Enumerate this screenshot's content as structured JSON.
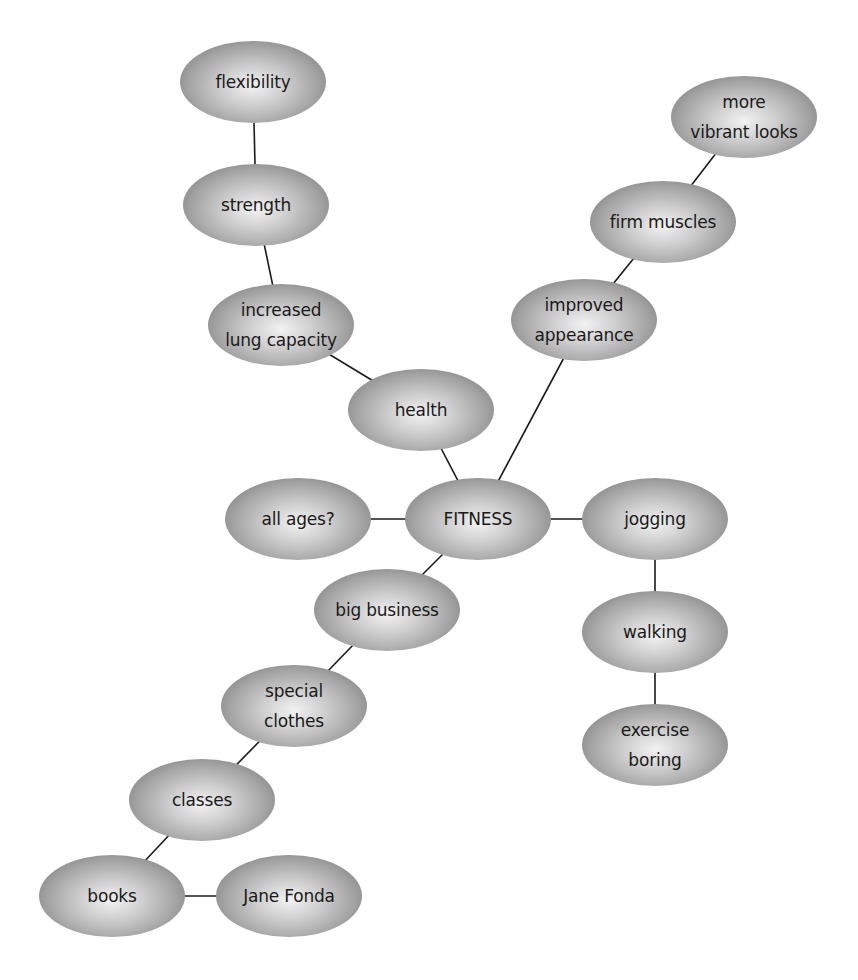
{
  "diagram": {
    "type": "mind-map",
    "central_topic": "FITNESS",
    "nodes": [
      {
        "id": "flexibility",
        "label": "flexibility",
        "x": 253,
        "y": 82
      },
      {
        "id": "strength",
        "label": "strength",
        "x": 256,
        "y": 205
      },
      {
        "id": "lung",
        "label": "increased\nlung capacity",
        "x": 281,
        "y": 325
      },
      {
        "id": "health",
        "label": "health",
        "x": 421,
        "y": 410
      },
      {
        "id": "appearance",
        "label": "improved\nappearance",
        "x": 584,
        "y": 320
      },
      {
        "id": "muscles",
        "label": "firm muscles",
        "x": 663,
        "y": 222
      },
      {
        "id": "vibrant",
        "label": "more\nvibrant looks",
        "x": 744,
        "y": 117
      },
      {
        "id": "ages",
        "label": "all ages?",
        "x": 298,
        "y": 519
      },
      {
        "id": "fitness",
        "label": "FITNESS",
        "x": 478,
        "y": 519
      },
      {
        "id": "jogging",
        "label": "jogging",
        "x": 655,
        "y": 519
      },
      {
        "id": "business",
        "label": "big business",
        "x": 387,
        "y": 610
      },
      {
        "id": "walking",
        "label": "walking",
        "x": 655,
        "y": 632
      },
      {
        "id": "clothes",
        "label": "special\nclothes",
        "x": 294,
        "y": 706
      },
      {
        "id": "boring",
        "label": "exercise\nboring",
        "x": 655,
        "y": 745
      },
      {
        "id": "classes",
        "label": "classes",
        "x": 202,
        "y": 800
      },
      {
        "id": "books",
        "label": "books",
        "x": 112,
        "y": 896
      },
      {
        "id": "fonda",
        "label": "Jane Fonda",
        "x": 289,
        "y": 896
      }
    ],
    "edges": [
      [
        "flexibility",
        "strength"
      ],
      [
        "strength",
        "lung"
      ],
      [
        "lung",
        "health"
      ],
      [
        "health",
        "fitness"
      ],
      [
        "fitness",
        "appearance"
      ],
      [
        "appearance",
        "muscles"
      ],
      [
        "muscles",
        "vibrant"
      ],
      [
        "ages",
        "fitness"
      ],
      [
        "fitness",
        "jogging"
      ],
      [
        "jogging",
        "walking"
      ],
      [
        "walking",
        "boring"
      ],
      [
        "fitness",
        "business"
      ],
      [
        "business",
        "clothes"
      ],
      [
        "clothes",
        "classes"
      ],
      [
        "classes",
        "books"
      ],
      [
        "books",
        "fonda"
      ]
    ],
    "colors": {
      "edge": "#1a1a1a",
      "node_center": "#f2f2f2",
      "node_edge": "#6e6e6e",
      "text": "#1a1a1a",
      "background": "#ffffff"
    }
  }
}
